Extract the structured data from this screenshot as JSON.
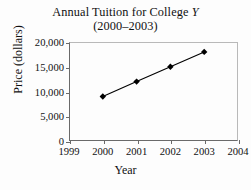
{
  "chart_data": {
    "type": "line",
    "title": "Annual Tuition for College Y",
    "title_plain": "Annual Tuition for College ",
    "title_italic": "Y",
    "subtitle": "(2000–2003)",
    "xlabel": "Year",
    "ylabel": "Price (dollars)",
    "x": [
      2000,
      2001,
      2002,
      2003
    ],
    "values": [
      9000,
      12000,
      15000,
      18000
    ],
    "series": [
      {
        "name": "Annual Tuition",
        "values": [
          9000,
          12000,
          15000,
          18000
        ],
        "marker": "diamond",
        "color": "#000000"
      }
    ],
    "xlim": [
      1999,
      2004
    ],
    "ylim": [
      0,
      20000
    ],
    "xticks": [
      1999,
      2000,
      2001,
      2002,
      2003,
      2004
    ],
    "xticklabels": [
      "1999",
      "2000",
      "2001",
      "2002",
      "2003",
      "2004"
    ],
    "yticks": [
      0,
      5000,
      10000,
      15000,
      20000
    ],
    "yticklabels": [
      "0",
      "5,000",
      "10,000",
      "15,000",
      "20,000"
    ],
    "grid": false,
    "legend": null,
    "legend_position": "none",
    "axis_color": "#6a6a6a",
    "frame_color": "#b9b9b9",
    "background": "#fdfdfd"
  },
  "figure": {
    "width": 251,
    "height": 190
  }
}
